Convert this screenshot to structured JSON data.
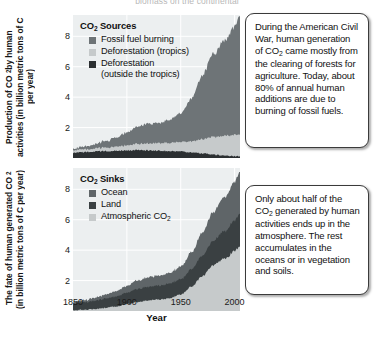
{
  "figure": {
    "top_caption": "biomass on the continental"
  },
  "panel1": {
    "y_axis_title_parts": [
      "Production of CO",
      "2",
      " by human activities (in billion metric tons of C per year)"
    ],
    "y_axis_title": "Production of CO2 by human activities (in billion metric tons of C per year)",
    "legend_title_parts": [
      "CO",
      "2",
      " Sources"
    ],
    "legend_items": [
      {
        "label": "Fossil fuel burning",
        "color": "#6e7477"
      },
      {
        "label": "Deforestation (tropics)",
        "color": "#c6cacb"
      },
      {
        "label": "Deforestation\n(outside the tropics)",
        "color": "#2b2f31"
      }
    ],
    "callout": {
      "text_parts": [
        "During the American Civil War, human generation of CO",
        "2",
        " came mostly from the clearing of forests for agriculture. Today, about 80% of annual human additions are due to burning of fossil fuels."
      ],
      "text": "During the American Civil War, human generation of CO2 came mostly from the clearing of forests for agriculture. Today, about 80% of annual human additions are due to burning of fossil fuels."
    }
  },
  "panel2": {
    "y_axis_title_parts": [
      "The fate of human generated CO",
      "2",
      " (in billion metric tons of C per year)"
    ],
    "y_axis_title": "The fate of human generated CO2 (in billion metric tons of C per year)",
    "legend_title_parts": [
      "CO",
      "2",
      " Sinks"
    ],
    "legend_items": [
      {
        "label": "Ocean",
        "color": "#5f6568"
      },
      {
        "label": "Land",
        "color": "#3a4042"
      },
      {
        "label": "Atmospheric CO2",
        "color": "#c6cacb"
      }
    ],
    "callout": {
      "text_parts": [
        "Only about half of the CO",
        "2",
        " generated by human activities ends up in the atmosphere. The rest accumulates in the oceans or in vegetation and soils."
      ],
      "text": "Only about half of the CO2 generated by human activities ends up in the atmosphere. The rest accumulates in the oceans or in vegetation and soils."
    }
  },
  "x_axis": {
    "title": "Year",
    "ticks": [
      1850,
      1900,
      1950,
      2000
    ],
    "range": [
      1850,
      2005
    ]
  },
  "y_axis": {
    "ticks": [
      2,
      4,
      6,
      8
    ],
    "range": [
      0,
      9.4
    ],
    "unit": "billion metric tons of C per year"
  },
  "chart_data": [
    {
      "type": "area",
      "title": "CO2 Sources",
      "stacked": true,
      "xlabel": "Year",
      "ylabel": "Production of CO2 by human activities (in billion metric tons of C per year)",
      "xlim": [
        1850,
        2005
      ],
      "ylim": [
        0,
        9.4
      ],
      "xticks": [
        1850,
        1900,
        1950,
        2000
      ],
      "yticks": [
        2,
        4,
        6,
        8
      ],
      "grid": true,
      "legend_position": "inside-top-left",
      "x": [
        1850,
        1860,
        1870,
        1880,
        1890,
        1900,
        1910,
        1920,
        1930,
        1940,
        1950,
        1960,
        1970,
        1980,
        1990,
        2000,
        2005
      ],
      "series": [
        {
          "name": "Deforestation (outside the tropics)",
          "color": "#2b2f31",
          "values": [
            0.35,
            0.38,
            0.42,
            0.45,
            0.48,
            0.5,
            0.52,
            0.5,
            0.48,
            0.45,
            0.42,
            0.38,
            0.3,
            0.22,
            0.16,
            0.12,
            0.1
          ]
        },
        {
          "name": "Deforestation (tropics)",
          "color": "#c6cacb",
          "values": [
            0.15,
            0.18,
            0.2,
            0.24,
            0.28,
            0.34,
            0.4,
            0.45,
            0.5,
            0.55,
            0.62,
            0.74,
            0.92,
            1.15,
            1.3,
            1.4,
            1.45
          ]
        },
        {
          "name": "Fossil fuel burning",
          "color": "#6e7477",
          "values": [
            0.1,
            0.18,
            0.28,
            0.42,
            0.6,
            0.85,
            1.15,
            1.3,
            1.35,
            1.5,
            1.9,
            2.8,
            4.2,
            5.4,
            6.2,
            7.1,
            7.8
          ]
        }
      ]
    },
    {
      "type": "area",
      "title": "CO2 Sinks",
      "stacked": true,
      "xlabel": "Year",
      "ylabel": "The fate of human generated CO2 (in billion metric tons of C per year)",
      "xlim": [
        1850,
        2005
      ],
      "ylim": [
        0,
        9.4
      ],
      "xticks": [
        1850,
        1900,
        1950,
        2000
      ],
      "yticks": [
        2,
        4,
        6,
        8
      ],
      "grid": true,
      "legend_position": "inside-top-left",
      "x": [
        1850,
        1860,
        1870,
        1880,
        1890,
        1900,
        1910,
        1920,
        1930,
        1940,
        1950,
        1960,
        1970,
        1980,
        1990,
        2000,
        2005
      ],
      "series": [
        {
          "name": "Atmospheric CO2",
          "color": "#c6cacb",
          "values": [
            0.05,
            0.08,
            0.12,
            0.2,
            0.3,
            0.45,
            0.6,
            0.7,
            0.75,
            0.85,
            1.1,
            1.6,
            2.3,
            3.0,
            3.4,
            3.9,
            4.3
          ]
        },
        {
          "name": "Land",
          "color": "#3a4042",
          "values": [
            0.45,
            0.5,
            0.55,
            0.6,
            0.68,
            0.75,
            0.85,
            0.9,
            0.92,
            0.95,
            1.0,
            1.15,
            1.35,
            1.6,
            1.8,
            2.0,
            2.1
          ]
        },
        {
          "name": "Ocean",
          "color": "#5f6568",
          "values": [
            0.1,
            0.14,
            0.2,
            0.26,
            0.34,
            0.45,
            0.56,
            0.62,
            0.66,
            0.7,
            0.84,
            1.1,
            1.5,
            1.9,
            2.2,
            2.5,
            2.75
          ]
        }
      ]
    }
  ]
}
